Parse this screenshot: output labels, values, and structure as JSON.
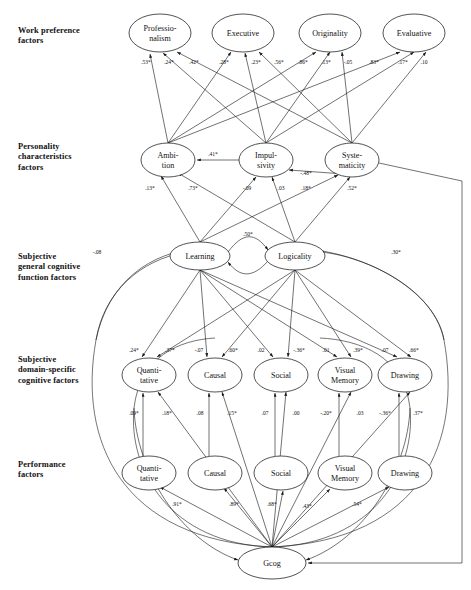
{
  "diagram": {
    "type": "path-diagram",
    "row_labels": [
      {
        "id": "work-preference",
        "text": "Work preference\nfactors",
        "x": 18,
        "y": 26
      },
      {
        "id": "personality",
        "text": "Personality\ncharacteristics\nfactors",
        "x": 18,
        "y": 142
      },
      {
        "id": "general-cognitive",
        "text": "Subjective\ngeneral cognitive\nfunction factors",
        "x": 18,
        "y": 252
      },
      {
        "id": "domain-specific",
        "text": "Subjective\ndomain-specific\ncognitive factors",
        "x": 18,
        "y": 355
      },
      {
        "id": "performance",
        "text": "Performance\nfactors",
        "x": 18,
        "y": 460
      }
    ],
    "nodes": [
      {
        "id": "professionalism",
        "lines": [
          "Professio-",
          "nalism"
        ],
        "cx": 160,
        "cy": 33,
        "rx": 31,
        "ry": 19
      },
      {
        "id": "executive",
        "lines": [
          "Executive"
        ],
        "cx": 243,
        "cy": 33,
        "rx": 31,
        "ry": 19
      },
      {
        "id": "originality",
        "lines": [
          "Originality"
        ],
        "cx": 330,
        "cy": 33,
        "rx": 31,
        "ry": 19
      },
      {
        "id": "evaluative",
        "lines": [
          "Evaluative"
        ],
        "cx": 414,
        "cy": 33,
        "rx": 31,
        "ry": 19
      },
      {
        "id": "ambition",
        "lines": [
          "Ambi-",
          "tion"
        ],
        "cx": 168,
        "cy": 160,
        "rx": 27,
        "ry": 17
      },
      {
        "id": "impulsivity",
        "lines": [
          "Impul-",
          "sivity"
        ],
        "cx": 266,
        "cy": 160,
        "rx": 27,
        "ry": 17
      },
      {
        "id": "systematicity",
        "lines": [
          "Syste-",
          "maticity"
        ],
        "cx": 352,
        "cy": 160,
        "rx": 27,
        "ry": 17
      },
      {
        "id": "learning",
        "lines": [
          "Learning"
        ],
        "cx": 200,
        "cy": 256,
        "rx": 30,
        "ry": 14
      },
      {
        "id": "logicality",
        "lines": [
          "Logicality"
        ],
        "cx": 295,
        "cy": 256,
        "rx": 30,
        "ry": 14
      },
      {
        "id": "quantitative-subj",
        "lines": [
          "Quanti-",
          "tative"
        ],
        "cx": 149,
        "cy": 375,
        "rx": 27,
        "ry": 17
      },
      {
        "id": "causal-subj",
        "lines": [
          "Causal"
        ],
        "cx": 215,
        "cy": 375,
        "rx": 27,
        "ry": 17
      },
      {
        "id": "social-subj",
        "lines": [
          "Social"
        ],
        "cx": 281,
        "cy": 375,
        "rx": 27,
        "ry": 17
      },
      {
        "id": "visualmemory-subj",
        "lines": [
          "Visual",
          "Memory"
        ],
        "cx": 345,
        "cy": 375,
        "rx": 27,
        "ry": 17
      },
      {
        "id": "drawing-subj",
        "lines": [
          "Drawing"
        ],
        "cx": 405,
        "cy": 375,
        "rx": 27,
        "ry": 17
      },
      {
        "id": "quantitative-perf",
        "lines": [
          "Quanti-",
          "tative"
        ],
        "cx": 149,
        "cy": 473,
        "rx": 27,
        "ry": 17
      },
      {
        "id": "causal-perf",
        "lines": [
          "Causal"
        ],
        "cx": 215,
        "cy": 473,
        "rx": 27,
        "ry": 17
      },
      {
        "id": "social-perf",
        "lines": [
          "Social"
        ],
        "cx": 281,
        "cy": 473,
        "rx": 27,
        "ry": 17
      },
      {
        "id": "visualmemory-perf",
        "lines": [
          "Visual",
          "Memory"
        ],
        "cx": 345,
        "cy": 473,
        "rx": 27,
        "ry": 17
      },
      {
        "id": "drawing-perf",
        "lines": [
          "Drawing"
        ],
        "cx": 405,
        "cy": 473,
        "rx": 27,
        "ry": 17
      },
      {
        "id": "gcog",
        "lines": [
          "Gcog"
        ],
        "cx": 272,
        "cy": 563,
        "rx": 34,
        "ry": 16
      }
    ],
    "coefficients": [
      {
        "id": "amb-prof",
        "value": ".53*",
        "x": 146,
        "y": 64
      },
      {
        "id": "imp-prof",
        "value": ".24*",
        "x": 169,
        "y": 64
      },
      {
        "id": "sys-prof",
        "value": ".42*",
        "x": 194,
        "y": 64
      },
      {
        "id": "amb-exec",
        "value": ".28*",
        "x": 224,
        "y": 64
      },
      {
        "id": "imp-exec",
        "value": ".23*",
        "x": 256,
        "y": 64
      },
      {
        "id": "sys-exec",
        "value": ".56*",
        "x": 279,
        "y": 64
      },
      {
        "id": "amb-orig",
        "value": ".86*",
        "x": 303,
        "y": 64
      },
      {
        "id": "imp-orig",
        "value": ".13*",
        "x": 326,
        "y": 64
      },
      {
        "id": "sys-orig",
        "value": "-.05",
        "x": 348,
        "y": 64
      },
      {
        "id": "amb-eval",
        "value": ".83*",
        "x": 374,
        "y": 64
      },
      {
        "id": "imp-eval",
        "value": ".17*",
        "x": 403,
        "y": 64
      },
      {
        "id": "sys-eval",
        "value": ".10",
        "x": 424,
        "y": 64
      },
      {
        "id": "imp-amb",
        "value": ".41*",
        "x": 213,
        "y": 156
      },
      {
        "id": "sys-imp",
        "value": "-.48*",
        "x": 306,
        "y": 175
      },
      {
        "id": "lrn-amb",
        "value": ".13*",
        "x": 150,
        "y": 190
      },
      {
        "id": "log-amb",
        "value": ".73*",
        "x": 193,
        "y": 190
      },
      {
        "id": "lrn-imp",
        "value": "-.09",
        "x": 247,
        "y": 190
      },
      {
        "id": "log-imp",
        "value": ".03",
        "x": 281,
        "y": 190
      },
      {
        "id": "lrn-sys",
        "value": ".18*",
        "x": 306,
        "y": 190
      },
      {
        "id": "log-sys",
        "value": ".52*",
        "x": 352,
        "y": 190
      },
      {
        "id": "lrn-log",
        "value": ".50*",
        "x": 248,
        "y": 236
      },
      {
        "id": "gcog-lrn",
        "value": "-.08",
        "x": 97,
        "y": 254
      },
      {
        "id": "gcog-log",
        "value": ".30*",
        "x": 396,
        "y": 254
      },
      {
        "id": "lrn-quant",
        "value": ".24*",
        "x": 134,
        "y": 352
      },
      {
        "id": "log-quant",
        "value": ".37*",
        "x": 170,
        "y": 352
      },
      {
        "id": "lrn-causal",
        "value": "-.07",
        "x": 199,
        "y": 352
      },
      {
        "id": "log-causal",
        "value": ".60*",
        "x": 233,
        "y": 352
      },
      {
        "id": "lrn-social",
        "value": ".02",
        "x": 261,
        "y": 352
      },
      {
        "id": "log-social",
        "value": "-.36*",
        "x": 299,
        "y": 352
      },
      {
        "id": "lrn-vismem",
        "value": ".01",
        "x": 326,
        "y": 352
      },
      {
        "id": "log-vismem",
        "value": ".39*",
        "x": 358,
        "y": 352
      },
      {
        "id": "lrn-drawing",
        "value": ".07",
        "x": 385,
        "y": 352
      },
      {
        "id": "log-drawing",
        "value": ".66*",
        "x": 414,
        "y": 352
      },
      {
        "id": "q-quant",
        "value": ".09*",
        "x": 134,
        "y": 415
      },
      {
        "id": "g-quant",
        "value": ".18*",
        "x": 167,
        "y": 415
      },
      {
        "id": "c-causal",
        "value": ".08",
        "x": 200,
        "y": 415
      },
      {
        "id": "g-causal",
        "value": ".15*",
        "x": 232,
        "y": 415
      },
      {
        "id": "s-social",
        "value": ".07",
        "x": 265,
        "y": 415
      },
      {
        "id": "g-social",
        "value": ".00",
        "x": 296,
        "y": 415
      },
      {
        "id": "v-vismem",
        "value": "-.20*",
        "x": 326,
        "y": 415
      },
      {
        "id": "g-vismem",
        "value": ".03",
        "x": 360,
        "y": 415
      },
      {
        "id": "d-drawing",
        "value": "-.36*",
        "x": 385,
        "y": 415
      },
      {
        "id": "g-drawing",
        "value": ".37*",
        "x": 418,
        "y": 415
      },
      {
        "id": "gcog-quantperf",
        "value": ".91*",
        "x": 177,
        "y": 506
      },
      {
        "id": "gcog-causalperf",
        "value": ".89*",
        "x": 234,
        "y": 506
      },
      {
        "id": "gcog-socialperf",
        "value": ".68*",
        "x": 272,
        "y": 506
      },
      {
        "id": "gcog-vismemperf",
        "value": ".43*",
        "x": 307,
        "y": 508
      },
      {
        "id": "gcog-drawingperf",
        "value": ".54*",
        "x": 357,
        "y": 506
      }
    ]
  }
}
